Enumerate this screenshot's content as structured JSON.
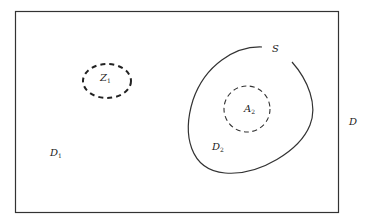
{
  "diagram": {
    "colors": {
      "stroke": "#333333",
      "text": "#222222",
      "background": "#ffffff"
    },
    "outer_region": {
      "label": "D",
      "shape": "rectangle"
    },
    "regions": [
      {
        "id": "D1",
        "base": "D",
        "sub": "1",
        "description": "exterior region inside rectangle"
      },
      {
        "id": "D2",
        "base": "D",
        "sub": "2",
        "description": "region inside closed curve S"
      }
    ],
    "curve": {
      "label": "S",
      "style": "solid",
      "open_gap": true
    },
    "dashed_regions": [
      {
        "id": "Z1",
        "base": "Z",
        "sub": "1",
        "location": "in D1"
      },
      {
        "id": "A2",
        "base": "A",
        "sub": "2",
        "location": "in D2"
      }
    ]
  }
}
